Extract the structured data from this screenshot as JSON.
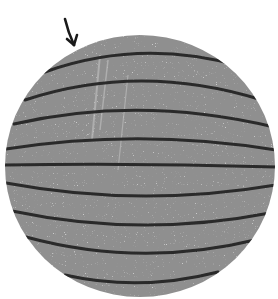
{
  "figure": {
    "background_color": "#ffffff",
    "sphere": {
      "fill_color": "#8f8f8f",
      "speckle_color": "#d8d8d8",
      "cx": 140,
      "cy": 166,
      "rx": 135,
      "ry": 131
    },
    "stripes": {
      "color": "#2a2a2a",
      "count": 9
    },
    "arrow": {
      "color": "#1a1a1a",
      "direction": "pointing down-right toward top of sphere"
    }
  }
}
